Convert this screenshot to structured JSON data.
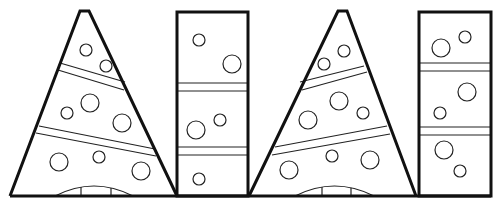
{
  "colors": {
    "stroke": "#111111",
    "background": "#ffffff"
  },
  "shapes": [
    {
      "type": "cone",
      "name": "cone-1",
      "apex": [
        [
          80,
          11
        ],
        [
          89,
          11
        ]
      ],
      "base": [
        10,
        177
      ],
      "base_y": 196,
      "bands": [
        [
          [
            60,
            63
          ],
          [
            125,
            82
          ],
          [
            58,
            70
          ],
          [
            124,
            90
          ]
        ],
        [
          [
            39,
            126
          ],
          [
            155,
            149
          ],
          [
            36,
            133
          ],
          [
            156,
            156
          ]
        ]
      ],
      "circles": [
        [
          86,
          50,
          6
        ],
        [
          106,
          66,
          6
        ],
        [
          90,
          103,
          9
        ],
        [
          67,
          113,
          6
        ],
        [
          122,
          123,
          9
        ],
        [
          59,
          162,
          9
        ],
        [
          99,
          157,
          6
        ],
        [
          141,
          171,
          9
        ]
      ],
      "arch": {
        "x1": 55,
        "x2": 133,
        "y": 196,
        "h": 10,
        "dividers": [
          81,
          111
        ]
      }
    },
    {
      "type": "rect",
      "name": "rect-1",
      "x": 177,
      "y": 12,
      "w": 71,
      "h": 184,
      "bands": [
        [
          83,
          91
        ],
        [
          147,
          155
        ]
      ],
      "circles": [
        [
          199,
          40,
          6
        ],
        [
          232,
          64,
          9
        ],
        [
          220,
          120,
          6
        ],
        [
          196,
          130,
          9
        ],
        [
          199,
          179,
          6
        ]
      ]
    },
    {
      "type": "cone",
      "name": "cone-2",
      "apex": [
        [
          338,
          11
        ],
        [
          347,
          11
        ]
      ],
      "base": [
        249,
        416
      ],
      "base_y": 196,
      "bands": [
        [
          [
            364,
            66
          ],
          [
            300,
            82
          ],
          [
            367,
            72
          ],
          [
            302,
            90
          ]
        ],
        [
          [
            387,
            126
          ],
          [
            275,
            147
          ],
          [
            390,
            134
          ],
          [
            272,
            155
          ]
        ]
      ],
      "circles": [
        [
          344,
          51,
          6
        ],
        [
          324,
          64,
          6
        ],
        [
          339,
          101,
          9
        ],
        [
          363,
          113,
          6
        ],
        [
          308,
          120,
          9
        ],
        [
          332,
          156,
          6
        ],
        [
          370,
          160,
          9
        ],
        [
          289,
          170,
          9
        ]
      ],
      "arch": {
        "x1": 295,
        "x2": 374,
        "y": 196,
        "h": 10,
        "dividers": [
          322,
          351
        ]
      }
    },
    {
      "type": "rect",
      "name": "rect-2",
      "x": 419,
      "y": 12,
      "w": 72,
      "h": 184,
      "bands": [
        [
          63,
          71
        ],
        [
          127,
          135
        ]
      ],
      "circles": [
        [
          465,
          37,
          6
        ],
        [
          441,
          48,
          9
        ],
        [
          467,
          92,
          9
        ],
        [
          440,
          113,
          6
        ],
        [
          444,
          150,
          9
        ],
        [
          460,
          171,
          6
        ]
      ]
    }
  ],
  "ground_line": {
    "x1": 10,
    "x2": 491,
    "y": 196
  }
}
